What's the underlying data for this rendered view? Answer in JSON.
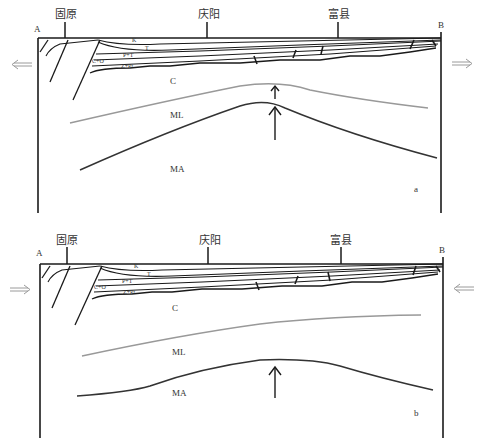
{
  "colors": {
    "line": "#1a1a1a",
    "moho_lithosphere_line": "#999999",
    "asthenosphere_line": "#333333",
    "stress_arrow": "#9a9a9a"
  },
  "panels": [
    {
      "id": "a",
      "panel_label": "a",
      "endpoint_left": "A",
      "endpoint_right": "B",
      "places": [
        "固原",
        "庆阳",
        "富县"
      ],
      "layers": [
        "K",
        "T",
        "P+T",
        "C+O",
        "Z+Pt"
      ],
      "regions": [
        "C",
        "ML",
        "MA"
      ],
      "stress_direction": "extension (arrows pointing outward)",
      "uplift_arrows": 2
    },
    {
      "id": "b",
      "panel_label": "b",
      "endpoint_left": "A",
      "endpoint_right": "B",
      "places": [
        "固原",
        "庆阳",
        "富县"
      ],
      "layers": [
        "K",
        "T",
        "P+T",
        "C+O",
        "Z+Pt"
      ],
      "regions": [
        "C",
        "ML",
        "MA"
      ],
      "stress_direction": "compression (arrows pointing inward)",
      "uplift_arrows": 1
    }
  ]
}
